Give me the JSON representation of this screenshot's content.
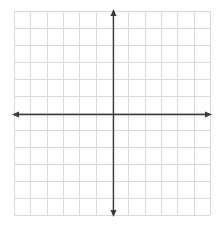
{
  "diagram": {
    "type": "coordinate-plane",
    "grid": {
      "columns": 12,
      "rows": 12,
      "left": 14,
      "top": 11,
      "right": 210,
      "bottom": 215,
      "line_color": "#d9d9d9"
    },
    "axes": {
      "x_axis_y": 114,
      "y_axis_x": 113,
      "x_start": 12,
      "x_end": 212,
      "y_start": 9,
      "y_end": 217,
      "color": "#3a3a3a",
      "arrows": [
        "left",
        "right",
        "up",
        "down"
      ]
    },
    "labels": []
  }
}
